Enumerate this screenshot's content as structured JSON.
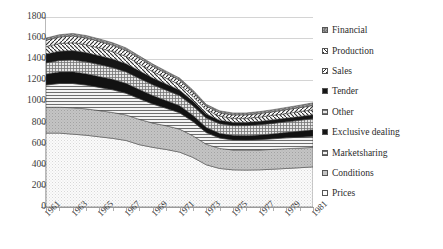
{
  "chart_data": {
    "type": "area",
    "stacked": true,
    "title": "",
    "xlabel": "",
    "ylabel": "",
    "ylim": [
      0,
      1800
    ],
    "ytick_step": 200,
    "yticks": [
      0,
      200,
      400,
      600,
      800,
      1000,
      1200,
      1400,
      1600,
      1800
    ],
    "grid": true,
    "grid_axis": "y",
    "legend_position": "right",
    "x": [
      1961,
      1962,
      1963,
      1964,
      1965,
      1966,
      1967,
      1968,
      1969,
      1970,
      1971,
      1972,
      1973,
      1974,
      1975,
      1976,
      1977,
      1978,
      1979,
      1980,
      1981
    ],
    "xtick_labels": [
      "1961",
      "1963",
      "1965",
      "1967",
      "1969",
      "1971",
      "1973",
      "1975",
      "1977",
      "1979",
      "1981"
    ],
    "series": [
      {
        "name": "Prices",
        "values": [
          700,
          700,
          690,
          680,
          665,
          650,
          630,
          590,
          565,
          545,
          520,
          470,
          400,
          365,
          352,
          350,
          352,
          358,
          365,
          372,
          380
        ]
      },
      {
        "name": "Conditions",
        "values": [
          245,
          245,
          250,
          250,
          248,
          245,
          242,
          240,
          230,
          225,
          218,
          205,
          195,
          190,
          188,
          188,
          188,
          188,
          188,
          186,
          185
        ]
      },
      {
        "name": "Marketsharing",
        "values": [
          210,
          225,
          230,
          225,
          220,
          215,
          205,
          195,
          180,
          165,
          155,
          135,
          110,
          98,
          95,
          95,
          98,
          100,
          102,
          103,
          105
        ]
      },
      {
        "name": "Exclusive dealing",
        "values": [
          105,
          110,
          112,
          108,
          104,
          100,
          95,
          88,
          82,
          74,
          68,
          60,
          50,
          46,
          44,
          44,
          45,
          48,
          52,
          58,
          62
        ]
      },
      {
        "name": "Other",
        "values": [
          105,
          108,
          110,
          112,
          112,
          110,
          108,
          105,
          100,
          98,
          95,
          90,
          88,
          90,
          92,
          94,
          96,
          98,
          100,
          102,
          104
        ]
      },
      {
        "name": "Tender",
        "values": [
          85,
          88,
          90,
          88,
          85,
          82,
          78,
          72,
          66,
          58,
          52,
          45,
          38,
          34,
          32,
          32,
          33,
          34,
          35,
          36,
          38
        ]
      },
      {
        "name": "Sales",
        "values": [
          70,
          72,
          74,
          74,
          72,
          70,
          68,
          64,
          60,
          56,
          52,
          46,
          40,
          38,
          38,
          38,
          40,
          42,
          44,
          46,
          48
        ]
      },
      {
        "name": "Production",
        "values": [
          60,
          62,
          64,
          64,
          62,
          60,
          58,
          54,
          50,
          46,
          42,
          38,
          34,
          32,
          32,
          32,
          33,
          34,
          36,
          38,
          40
        ]
      },
      {
        "name": "Financial",
        "values": [
          20,
          22,
          24,
          24,
          24,
          24,
          23,
          22,
          21,
          20,
          20,
          19,
          18,
          18,
          18,
          18,
          19,
          20,
          21,
          23,
          25
        ]
      }
    ],
    "legend_entries": [
      {
        "label": "Financial",
        "swatch": "checker-gray",
        "color": "#8c8c8c"
      },
      {
        "label": "Production",
        "swatch": "diagonal-up",
        "color": "#ffffff"
      },
      {
        "label": "Sales",
        "swatch": "diagonal-down",
        "color": "#ffffff"
      },
      {
        "label": "Tender",
        "swatch": "solid-black",
        "color": "#1a1a1a"
      },
      {
        "label": "Other",
        "swatch": "grid-fine",
        "color": "#d9d9d9"
      },
      {
        "label": "Exclusive dealing",
        "swatch": "solid-black",
        "color": "#111111"
      },
      {
        "label": "Marketsharing",
        "swatch": "horizontal",
        "color": "#e8e8e8"
      },
      {
        "label": "Conditions",
        "swatch": "dots-medium",
        "color": "#b8b8b8"
      },
      {
        "label": "Prices",
        "swatch": "dots-light",
        "color": "#f2f2f2"
      }
    ]
  },
  "axis": {
    "ytick_labels": [
      "1800",
      "1600",
      "1400",
      "1200",
      "1000",
      "800",
      "600",
      "400",
      "200",
      "0"
    ],
    "xtick_labels": [
      "1961",
      "1963",
      "1965",
      "1967",
      "1969",
      "1971",
      "1973",
      "1975",
      "1977",
      "1979",
      "1981"
    ]
  }
}
